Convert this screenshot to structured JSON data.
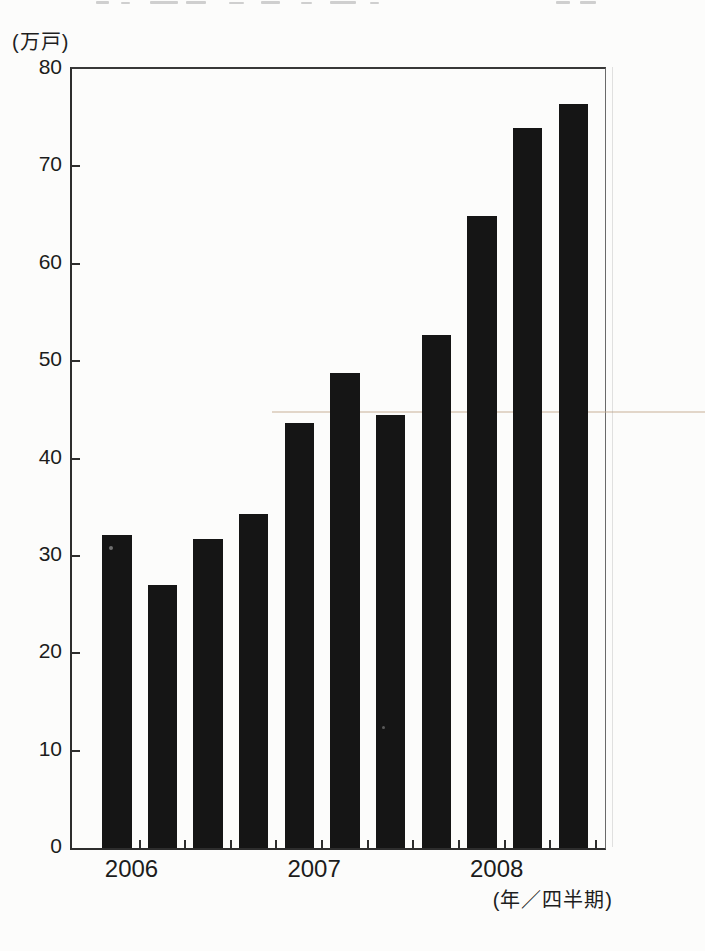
{
  "chart_data": {
    "type": "bar",
    "unit_label_y": "(万戸)",
    "unit_label_x": "(年／四半期)",
    "ylim": [
      0,
      80
    ],
    "ytick_step": 10,
    "yticks": [
      0,
      10,
      20,
      30,
      40,
      50,
      60,
      70,
      80
    ],
    "categories": [
      "2006 Q1",
      "2006 Q2",
      "2006 Q3",
      "2006 Q4",
      "2007 Q1",
      "2007 Q2",
      "2007 Q3",
      "2007 Q4",
      "2008 Q1",
      "2008 Q2",
      "2008 Q3"
    ],
    "values": [
      32.1,
      27.0,
      31.7,
      34.3,
      43.6,
      48.8,
      44.5,
      52.7,
      64.9,
      73.9,
      76.4
    ],
    "year_labels": [
      {
        "label": "2006",
        "bar_index": 0
      },
      {
        "label": "2007",
        "bar_index": 4
      },
      {
        "label": "2008",
        "bar_index": 8
      }
    ],
    "bar_color": "#151515",
    "axis_color": "#2d2d2d",
    "grid": false,
    "legend": false
  }
}
